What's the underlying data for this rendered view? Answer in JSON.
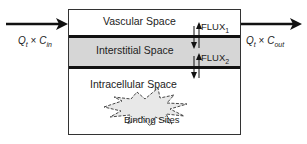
{
  "diagram": {
    "compartments": [
      {
        "name": "vascular",
        "label": "Vascular Space"
      },
      {
        "name": "interstitial",
        "label": "Interstitial Space"
      },
      {
        "name": "intracellular",
        "label": "Intracellular Space"
      }
    ],
    "fluxes": [
      {
        "label": "FLUX",
        "subscript": "1"
      },
      {
        "label": "FLUX",
        "subscript": "2"
      }
    ],
    "inflow": {
      "q": "Q",
      "q_sub": "t",
      "op": "×",
      "c": "C",
      "c_sub": "in"
    },
    "outflow": {
      "q": "Q",
      "q_sub": "t",
      "op": "×",
      "c": "C",
      "c_sub": "out"
    },
    "binding": {
      "label": "Binding Sites"
    },
    "colors": {
      "interstitial_fill": "#d6d6d6",
      "line": "#111111",
      "starburst_fill": "#e8e8e8"
    }
  }
}
